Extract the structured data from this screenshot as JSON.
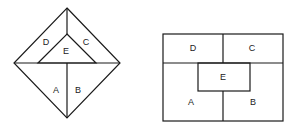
{
  "figures": [
    {
      "name": "diamond",
      "labels": {
        "A": "A",
        "B": "B",
        "C": "C",
        "D": "D",
        "E": "E"
      }
    },
    {
      "name": "rectangle",
      "labels": {
        "A": "A",
        "B": "B",
        "C": "C",
        "D": "D",
        "E": "E"
      }
    }
  ],
  "colors": {
    "stroke": "#1a1a1a",
    "background": "#ffffff"
  }
}
